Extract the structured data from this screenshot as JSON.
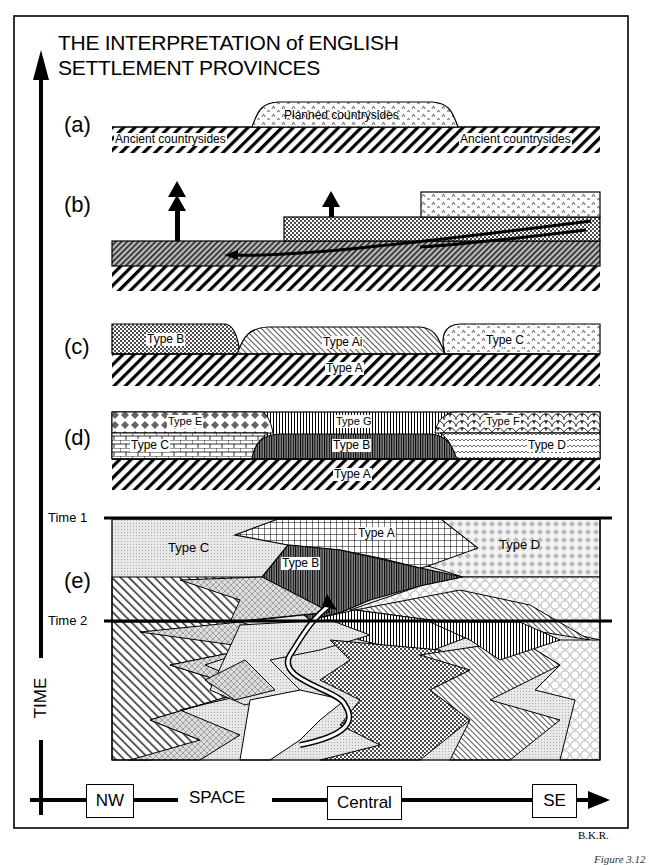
{
  "title": {
    "line1": "THE INTERPRETATION of ENGLISH",
    "line2": "SETTLEMENT PROVINCES"
  },
  "panels": {
    "a": {
      "label": "(a)",
      "planned": "Planned countrysides",
      "ancient_left": "Ancient countrysides",
      "ancient_right": "Ancient countrysides"
    },
    "b": {
      "label": "(b)"
    },
    "c": {
      "label": "(c)",
      "type_b": "Type B",
      "type_ai": "Type Ai",
      "type_c": "Type C",
      "type_a": "Type A"
    },
    "d": {
      "label": "(d)",
      "type_e": "Type E",
      "type_g": "Type G",
      "type_f": "Type F",
      "type_c": "Type C",
      "type_b": "Type B",
      "type_d": "Type D",
      "type_a": "Type A"
    },
    "e": {
      "label": "(e)",
      "time1": "Time 1",
      "time2": "Time 2",
      "type_c": "Type C",
      "type_a": "Type A",
      "type_b": "Type B",
      "type_d": "Type D"
    }
  },
  "axes": {
    "time_label": "TIME",
    "space_label": "SPACE",
    "nw": "NW",
    "central": "Central",
    "se": "SE"
  },
  "credit": "B.K.R.",
  "figure_caption": "Figure 3.12"
}
